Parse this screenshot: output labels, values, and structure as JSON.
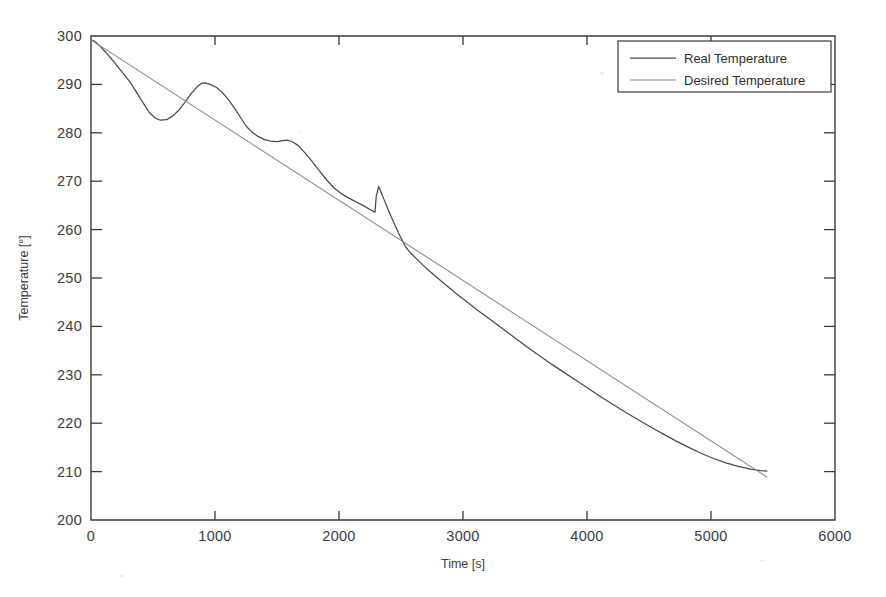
{
  "chart_data": {
    "type": "line",
    "title": "",
    "xlabel": "Time [s]",
    "ylabel": "Temperature [°]",
    "xlim": [
      0,
      6000
    ],
    "ylim": [
      200,
      300
    ],
    "xticks": [
      0,
      1000,
      2000,
      3000,
      4000,
      5000,
      6000
    ],
    "yticks": [
      200,
      210,
      220,
      230,
      240,
      250,
      260,
      270,
      280,
      290,
      300
    ],
    "grid": false,
    "legend_position": "top-right",
    "legend": [
      "Real Temperature",
      "Desired Temperature"
    ],
    "series": [
      {
        "name": "Real Temperature",
        "color": "#4a4a4a",
        "x": [
          0,
          30,
          70,
          120,
          180,
          250,
          320,
          400,
          470,
          520,
          560,
          610,
          660,
          710,
          760,
          810,
          860,
          890,
          920,
          960,
          1010,
          1060,
          1110,
          1160,
          1210,
          1250,
          1300,
          1350,
          1400,
          1450,
          1500,
          1550,
          1580,
          1620,
          1670,
          1720,
          1780,
          1840,
          1900,
          1960,
          2020,
          2080,
          2140,
          2200,
          2260,
          2290,
          2300,
          2320,
          2360,
          2420,
          2480,
          2540,
          2580,
          2640,
          2700,
          2780,
          2860,
          2940,
          3020,
          3120,
          3220,
          3320,
          3420,
          3520,
          3620,
          3720,
          3820,
          3920,
          4020,
          4120,
          4220,
          4320,
          4420,
          4520,
          4620,
          4720,
          4820,
          4920,
          5020,
          5120,
          5220,
          5320,
          5400,
          5450
        ],
        "y": [
          299.2,
          298.9,
          298.0,
          296.6,
          294.8,
          292.6,
          290.3,
          287.0,
          284.2,
          283.0,
          282.6,
          282.7,
          283.5,
          284.7,
          286.4,
          288.2,
          289.6,
          290.2,
          290.3,
          290.0,
          289.4,
          288.3,
          286.8,
          285.0,
          283.0,
          281.4,
          280.1,
          279.2,
          278.6,
          278.3,
          278.2,
          278.4,
          278.5,
          278.2,
          277.4,
          276.0,
          274.2,
          272.2,
          270.3,
          268.6,
          267.4,
          266.5,
          265.7,
          264.9,
          264.0,
          263.6,
          266.8,
          268.9,
          266.4,
          262.7,
          259.3,
          256.3,
          255.1,
          253.6,
          252.1,
          250.3,
          248.6,
          246.9,
          245.3,
          243.3,
          241.4,
          239.5,
          237.6,
          235.7,
          233.9,
          232.1,
          230.4,
          228.7,
          227.0,
          225.3,
          223.7,
          222.1,
          220.6,
          219.1,
          217.7,
          216.3,
          215.0,
          213.8,
          212.7,
          211.8,
          211.1,
          210.5,
          210.2,
          210.1
        ]
      },
      {
        "name": "Desired Temperature",
        "color": "#8c8c8c",
        "x": [
          0,
          5450
        ],
        "y": [
          299.2,
          208.9
        ]
      }
    ],
    "annotations": [
      {
        "label": "first undershoot",
        "x": 530,
        "y": 282.6
      },
      {
        "label": "first overshoot peak",
        "x": 900,
        "y": 290.3
      },
      {
        "label": "second plateau",
        "x": 1500,
        "y": 278.2
      },
      {
        "label": "spike",
        "x": 2300,
        "y": 268.9
      }
    ]
  },
  "axes": {
    "x_tick_labels": [
      "0",
      "1000",
      "2000",
      "3000",
      "4000",
      "5000",
      "6000"
    ],
    "y_tick_labels": [
      "200",
      "210",
      "220",
      "230",
      "240",
      "250",
      "260",
      "270",
      "280",
      "290",
      "300"
    ],
    "x_title": "Time [s]",
    "y_title": "Temperature [°]"
  },
  "legend": {
    "items": [
      {
        "label": "Real Temperature",
        "color": "#4a4a4a"
      },
      {
        "label": "Desired Temperature",
        "color": "#8c8c8c"
      }
    ]
  }
}
